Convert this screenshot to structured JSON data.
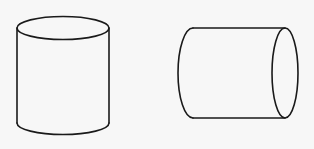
{
  "figure": {
    "background_color": "#f7f7f7",
    "stroke_color": "#1a1a1a",
    "shapes": [
      {
        "name": "upright-cylinder",
        "orientation": "vertical",
        "top_ellipse": {
          "cx": 63,
          "cy": 28,
          "rx": 46,
          "ry": 11.5
        },
        "side_top_y": 28,
        "side_bottom_y": 123,
        "bottom_arc_lowest_y": 135
      },
      {
        "name": "horizontal-cylinder",
        "orientation": "horizontal",
        "right_ellipse": {
          "cx": 285,
          "cy": 73,
          "rx": 13,
          "ry": 45
        },
        "top_y": 28,
        "bottom_y": 118,
        "left_x": 193,
        "left_arc_leftmost_x": 178
      }
    ]
  }
}
